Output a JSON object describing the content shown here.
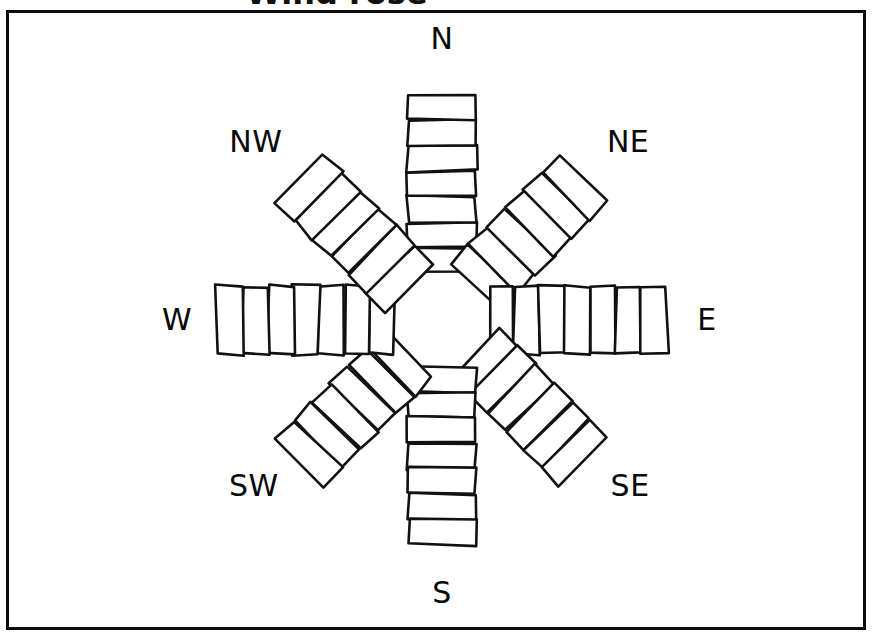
{
  "figure": {
    "title_clipped": "Wind rose",
    "background_color": "#ffffff",
    "stroke_color": "#111111",
    "frame": {
      "present": true,
      "color": "#0d0d0d"
    }
  },
  "labels": {
    "n": "N",
    "ne": "NE",
    "e": "E",
    "se": "SE",
    "s": "S",
    "sw": "SW",
    "w": "W",
    "nw": "NW"
  },
  "chart_data": {
    "type": "bar",
    "subtype": "wind-rose-polar-stacked",
    "title": "",
    "xlabel": "",
    "ylabel": "",
    "grid": false,
    "legend": "none",
    "categories": [
      "N",
      "NE",
      "E",
      "SE",
      "S",
      "SW",
      "W",
      "NW"
    ],
    "values": [
      7,
      6,
      7,
      6,
      7,
      6,
      7,
      6
    ],
    "series": [
      {
        "name": "segment count per direction",
        "values": [
          7,
          6,
          7,
          6,
          7,
          6,
          7,
          6
        ]
      }
    ]
  },
  "petals": [
    {
      "id": "n",
      "label": "N",
      "angle_deg": 0,
      "segments": 7,
      "length_px": 178,
      "width_px": 68
    },
    {
      "id": "ne",
      "label": "NE",
      "angle_deg": 45,
      "segments": 6,
      "length_px": 154,
      "width_px": 68
    },
    {
      "id": "e",
      "label": "E",
      "angle_deg": 90,
      "segments": 7,
      "length_px": 178,
      "width_px": 68
    },
    {
      "id": "se",
      "label": "SE",
      "angle_deg": 135,
      "segments": 6,
      "length_px": 154,
      "width_px": 68
    },
    {
      "id": "s",
      "label": "S",
      "angle_deg": 180,
      "segments": 7,
      "length_px": 178,
      "width_px": 68
    },
    {
      "id": "sw",
      "label": "SW",
      "angle_deg": 225,
      "segments": 6,
      "length_px": 154,
      "width_px": 68
    },
    {
      "id": "w",
      "label": "W",
      "angle_deg": 270,
      "segments": 7,
      "length_px": 178,
      "width_px": 68
    },
    {
      "id": "nw",
      "label": "NW",
      "angle_deg": 315,
      "segments": 6,
      "length_px": 154,
      "width_px": 68
    }
  ],
  "center": {
    "x": 442,
    "y": 320,
    "inner_radius_px": 47
  }
}
